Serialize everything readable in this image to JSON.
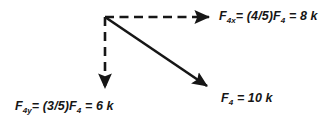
{
  "diagram": {
    "background_color": "#ffffff",
    "stroke_color": "#161616",
    "labels": {
      "x_component": {
        "symbol": "F",
        "subscript": "4x",
        "rest": "= (4/5)F",
        "sub2": "4",
        "value": "= 8 k",
        "full_text": "F4x= (4/5)F4 = 8 k"
      },
      "y_component": {
        "symbol": "F",
        "subscript": "4y",
        "rest": "= (3/5)F",
        "sub2": "4",
        "value": "= 6 k",
        "full_text": "F4y= (3/5)F4 = 6 k"
      },
      "resultant": {
        "symbol": "F",
        "subscript": "4",
        "value": "= 10 k",
        "full_text": "F4 = 10 k"
      }
    },
    "arrows": [
      {
        "name": "x-component-arrow",
        "style": "dashed",
        "from": [
          105,
          17
        ],
        "to": [
          214,
          17
        ],
        "direction": "right"
      },
      {
        "name": "y-component-arrow",
        "style": "dashed",
        "from": [
          105,
          17
        ],
        "to": [
          105,
          93
        ],
        "direction": "down"
      },
      {
        "name": "resultant-force-arrow",
        "style": "solid",
        "from": [
          105,
          17
        ],
        "to": [
          212,
          90
        ],
        "direction": "down-right"
      }
    ]
  }
}
